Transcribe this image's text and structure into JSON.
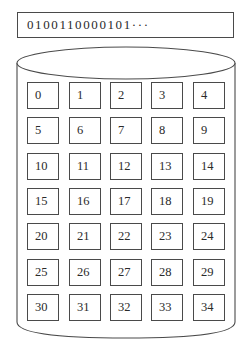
{
  "bitstream": {
    "text": "0100110000101···"
  },
  "storage": {
    "shape": "cylinder",
    "stroke_color": "#4a4a4a",
    "rows": 7,
    "columns": 5,
    "cells": [
      {
        "label": "0"
      },
      {
        "label": "1"
      },
      {
        "label": "2"
      },
      {
        "label": "3"
      },
      {
        "label": "4"
      },
      {
        "label": "5"
      },
      {
        "label": "6"
      },
      {
        "label": "7"
      },
      {
        "label": "8"
      },
      {
        "label": "9"
      },
      {
        "label": "10"
      },
      {
        "label": "11"
      },
      {
        "label": "12"
      },
      {
        "label": "13"
      },
      {
        "label": "14"
      },
      {
        "label": "15"
      },
      {
        "label": "16"
      },
      {
        "label": "17"
      },
      {
        "label": "18"
      },
      {
        "label": "19"
      },
      {
        "label": "20"
      },
      {
        "label": "21"
      },
      {
        "label": "22"
      },
      {
        "label": "23"
      },
      {
        "label": "24"
      },
      {
        "label": "25"
      },
      {
        "label": "26"
      },
      {
        "label": "27"
      },
      {
        "label": "28"
      },
      {
        "label": "29"
      },
      {
        "label": "30"
      },
      {
        "label": "31"
      },
      {
        "label": "32"
      },
      {
        "label": "33"
      },
      {
        "label": "34"
      }
    ]
  }
}
